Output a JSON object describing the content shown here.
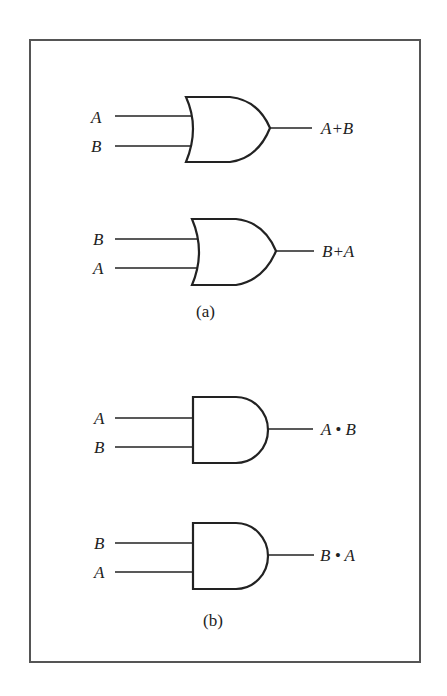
{
  "figure": {
    "part_a": {
      "caption": "(a)",
      "gates": [
        {
          "type": "OR",
          "inputs": [
            "A",
            "B"
          ],
          "output": "A+B"
        },
        {
          "type": "OR",
          "inputs": [
            "B",
            "A"
          ],
          "output": "B+A"
        }
      ]
    },
    "part_b": {
      "caption": "(b)",
      "gates": [
        {
          "type": "AND",
          "inputs": [
            "A",
            "B"
          ],
          "output": "A • B"
        },
        {
          "type": "AND",
          "inputs": [
            "B",
            "A"
          ],
          "output": "B • A"
        }
      ]
    },
    "colors": {
      "stroke": "#222222",
      "frame": "#555555",
      "background": "#ffffff"
    }
  }
}
